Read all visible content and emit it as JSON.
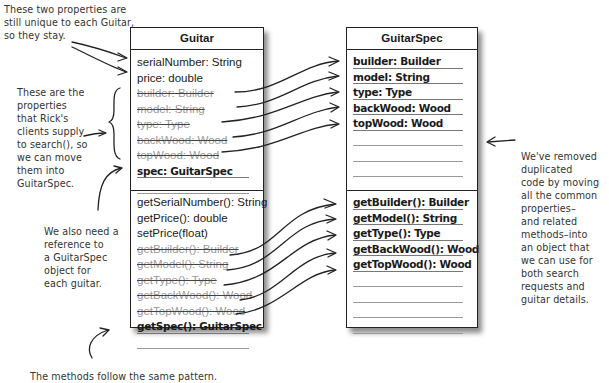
{
  "notes": {
    "top_left": "These two properties are\nstill unique to each Guitar,\nso they stay.",
    "left_middle": "These are the\nproperties\nthat Rick's\nclients supply\nto search(), so\nwe can move\nthem into\nGuitarSpec.",
    "left_lower": "We also need a\nreference to\na GuitarSpec\nobject for\neach guitar.",
    "right": "We've removed\nduplicated\ncode by moving\nall the common\nproperties–\nand related\nmethods–into\nan object that\nwe can use for\nboth search\nrequests and\nguitar details.",
    "bottom": "The methods follow the same pattern."
  },
  "guitar_class": {
    "name": "Guitar",
    "attributes": [
      {
        "text": "serialNumber: String",
        "style": "normal"
      },
      {
        "text": "price: double",
        "style": "normal"
      },
      {
        "text": "builder: Builder",
        "style": "struck"
      },
      {
        "text": "model: String",
        "style": "struck"
      },
      {
        "text": "type: Type",
        "style": "struck"
      },
      {
        "text": "backWood: Wood",
        "style": "struck"
      },
      {
        "text": "topWood: Wood",
        "style": "struck"
      },
      {
        "text": "spec: GuitarSpec",
        "style": "bold"
      }
    ],
    "methods": [
      {
        "text": "getSerialNumber(): String",
        "style": "normal"
      },
      {
        "text": "getPrice(): double",
        "style": "normal"
      },
      {
        "text": "setPrice(float)",
        "style": "normal"
      },
      {
        "text": "getBuilder(): Builder",
        "style": "struck"
      },
      {
        "text": "getModel(): String",
        "style": "struck"
      },
      {
        "text": "getType(): Type",
        "style": "struck"
      },
      {
        "text": "getBackWood(): Wood",
        "style": "struck"
      },
      {
        "text": "getTopWood(): Wood",
        "style": "struck"
      },
      {
        "text": "getSpec(): GuitarSpec",
        "style": "bold"
      }
    ]
  },
  "guitarspec_class": {
    "name": "GuitarSpec",
    "attributes": [
      {
        "text": "builder: Builder",
        "style": "bold"
      },
      {
        "text": "model: String",
        "style": "bold"
      },
      {
        "text": "type: Type",
        "style": "bold"
      },
      {
        "text": "backWood: Wood",
        "style": "bold"
      },
      {
        "text": "topWood: Wood",
        "style": "bold"
      }
    ],
    "methods": [
      {
        "text": "getBuilder(): Builder",
        "style": "bold"
      },
      {
        "text": "getModel(): String",
        "style": "bold"
      },
      {
        "text": "getType(): Type",
        "style": "bold"
      },
      {
        "text": "getBackWood(): Wood",
        "style": "bold"
      },
      {
        "text": "getTopWood(): Wood",
        "style": "bold"
      }
    ]
  },
  "colors": {
    "line": "#222222",
    "struck_text": "#999999",
    "note_text": "#333333"
  }
}
